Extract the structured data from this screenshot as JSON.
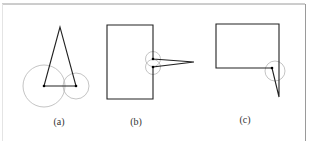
{
  "figure": {
    "panels": [
      {
        "id": "a",
        "caption": "(a)",
        "shape": "triangle with two circles at base vertices"
      },
      {
        "id": "b",
        "caption": "(b)",
        "shape": "rectangle with narrow spike and two circles on right edge"
      },
      {
        "id": "c",
        "caption": "(c)",
        "shape": "rectangle with spike at bottom-right corner and one circle"
      }
    ]
  },
  "colors": {
    "line": "#222222",
    "circle": "#b0b0b0",
    "frame": "#999999",
    "vertex": "#000000"
  }
}
